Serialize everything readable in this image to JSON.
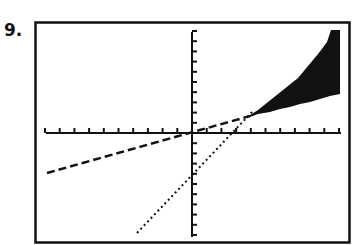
{
  "problem": {
    "number": "9."
  },
  "colors": {
    "ink": "#111111",
    "background": "#ffffff"
  },
  "chart_data": {
    "type": "line",
    "title": "",
    "xlabel": "",
    "ylabel": "",
    "xlim": [
      -10,
      10
    ],
    "ylim": [
      -10,
      10
    ],
    "xscale": 1,
    "yscale": 1,
    "grid": false,
    "legend": null,
    "series": [
      {
        "name": "dashed boundary line",
        "style": "dashed",
        "points": [
          [
            -10,
            -4
          ],
          [
            3.7,
            1.6
          ]
        ],
        "approx_equation": "y ≈ 0.4x + 0.2"
      },
      {
        "name": "dotted boundary line",
        "style": "dotted",
        "points": [
          [
            -3.8,
            -10
          ],
          [
            4.1,
            2.1
          ]
        ],
        "approx_equation": "y ≈ 1.5x − 3.5"
      }
    ],
    "shaded_region": {
      "description": "Solution region of the system of inequalities, above the dashed line and below the dotted line, to the right of their intersection",
      "vertex": [
        3.7,
        1.6
      ],
      "polygon": [
        [
          3.7,
          1.6
        ],
        [
          9.3,
          10.3
        ],
        [
          10,
          10.3
        ],
        [
          10,
          4.0
        ]
      ]
    }
  }
}
